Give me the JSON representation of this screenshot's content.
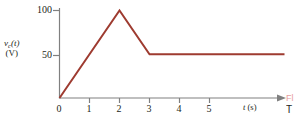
{
  "chart_data": {
    "type": "line",
    "title": "",
    "subtitle": "",
    "xlabel": "t (s)",
    "ylabel": "v_c(t) (V)",
    "ylabel_line1": "v",
    "ylabel_subscript": "c",
    "ylabel_line1_rest": "(t)",
    "ylabel_line2": "(V)",
    "xlabel_symbol": "t",
    "xlabel_unit": "(s)",
    "xlim": [
      0,
      7.5
    ],
    "ylim": [
      0,
      112
    ],
    "grid": false,
    "legend": "none",
    "x_ticks": [
      0,
      1,
      2,
      3,
      4,
      5
    ],
    "x_tick_labels": [
      "0",
      "1",
      "2",
      "3",
      "4",
      "5"
    ],
    "y_ticks": [
      50,
      100
    ],
    "y_tick_labels": [
      "50",
      "100"
    ],
    "axis_arrow_x": true,
    "series": [
      {
        "name": "v_c(t)",
        "color": "#9e3b30",
        "x": [
          0,
          2,
          3,
          7.5
        ],
        "y": [
          0,
          100,
          50,
          50
        ],
        "points": [
          {
            "x": 0,
            "y": 0
          },
          {
            "x": 2,
            "y": 100
          },
          {
            "x": 3,
            "y": 50
          },
          {
            "x": 7.5,
            "y": 50
          }
        ]
      }
    ],
    "annotations": []
  },
  "colors": {
    "trace": "#9e3b30",
    "axis": "#808080",
    "text": "#231f20",
    "background": "#ffffff",
    "caption_red": "#e8a0a0"
  },
  "caption": {
    "red_fragment": "Fl",
    "black_fragment": "T"
  }
}
